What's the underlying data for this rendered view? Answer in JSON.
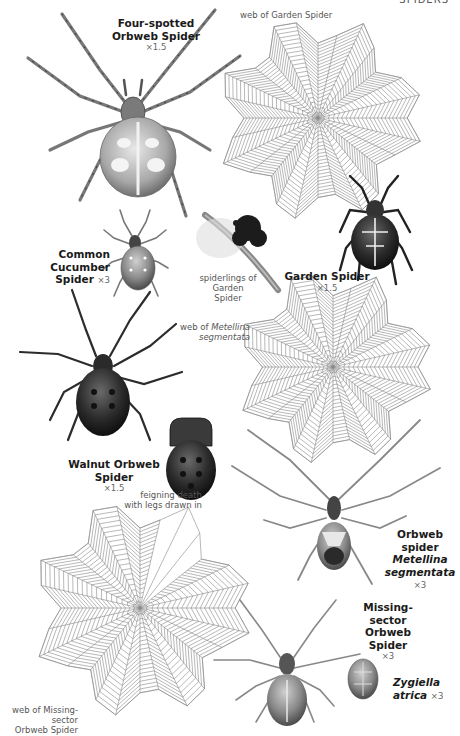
{
  "page": {
    "running_head": "SPIDERS",
    "background": "#ffffff",
    "ink_color": "#1a1a1a"
  },
  "labels": {
    "four_spotted": {
      "line1": "Four-spotted",
      "line2": "Orbweb Spider",
      "scale": "×1.5"
    },
    "garden_web": {
      "text": "web of Garden Spider"
    },
    "cucumber": {
      "line1": "Common Cucumber",
      "line2": "Spider",
      "scale": "×3"
    },
    "spiderlings": {
      "line1": "spiderlings of",
      "line2": "Garden Spider"
    },
    "garden": {
      "line1": "Garden Spider",
      "scale": "×1.5"
    },
    "metellina_web": {
      "prefix": "web of ",
      "line1_italic": "Metellina",
      "line2_italic": "segmentata"
    },
    "walnut": {
      "line1": "Walnut Orbweb Spider",
      "scale": "×1.5"
    },
    "feigning": {
      "line1": "feigning death",
      "line2": "with legs drawn in"
    },
    "metellina": {
      "line1": "Orbweb spider",
      "line2_italic": "Metellina",
      "line3_italic": "segmentata",
      "scale": "×3"
    },
    "missing_sector": {
      "line1": "Missing-sector",
      "line2": "Orbweb Spider",
      "scale": "×3"
    },
    "zygiella": {
      "line1_italic": "Zygiella",
      "line2_italic": "atrica",
      "scale": "×3"
    },
    "missing_web": {
      "line1": "web of Missing-sector",
      "line2": "Orbweb Spider"
    }
  },
  "illustrations": [
    {
      "id": "four-spotted-orbweb-spider",
      "kind": "spider"
    },
    {
      "id": "garden-spider-web",
      "kind": "web"
    },
    {
      "id": "common-cucumber-spider",
      "kind": "spider"
    },
    {
      "id": "garden-spider-spiderlings",
      "kind": "egg-cluster"
    },
    {
      "id": "garden-spider",
      "kind": "spider"
    },
    {
      "id": "metellina-web",
      "kind": "web"
    },
    {
      "id": "walnut-orbweb-spider",
      "kind": "spider"
    },
    {
      "id": "walnut-orbweb-feigning-death",
      "kind": "spider"
    },
    {
      "id": "metellina-segmentata",
      "kind": "spider"
    },
    {
      "id": "missing-sector-web",
      "kind": "web"
    },
    {
      "id": "missing-sector-orbweb-spider",
      "kind": "spider"
    },
    {
      "id": "zygiella-atrica-abdomen",
      "kind": "spider"
    }
  ]
}
